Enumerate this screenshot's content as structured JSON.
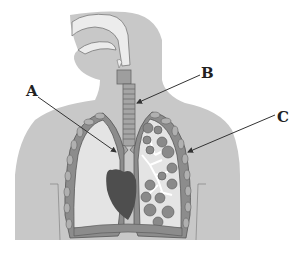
{
  "diagram": {
    "labels": {
      "a": "A",
      "b": "B",
      "c": "C"
    },
    "parts": [
      "nasal-cavity",
      "oral-cavity",
      "larynx",
      "trachea",
      "bronchi",
      "bronchioles",
      "alveoli",
      "left-lung",
      "right-lung",
      "heart",
      "ribs",
      "diaphragm"
    ],
    "colors": {
      "body": "#c8c8c8",
      "lung_tissue": "#e4e4e4",
      "trachea": "#9a9a9a",
      "heart": "#4e4e4e",
      "alveoli": "#8a8a8a",
      "arrow": "#333333"
    }
  }
}
